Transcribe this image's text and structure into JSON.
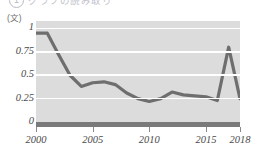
{
  "title_strip": {
    "circle_number": "1",
    "title": "グラフの読み取り",
    "visible": "partially-cropped"
  },
  "chart_data": {
    "type": "line",
    "title": "",
    "xlabel": "",
    "ylabel": "",
    "y_unit_label": "(文)",
    "grid": true,
    "legend": "none",
    "xlim": [
      2000,
      2018
    ],
    "ylim": [
      0,
      1.08
    ],
    "x_tick_labels": [
      "2000",
      "2005",
      "2010",
      "2015",
      "2018"
    ],
    "x_ticks": [
      2000,
      2005,
      2010,
      2015,
      2018
    ],
    "y_tick_labels": [
      "0",
      "0.25",
      "0.5",
      "0.75",
      "1"
    ],
    "y_ticks": [
      0,
      0.25,
      0.5,
      0.75,
      1
    ],
    "series": [
      {
        "name": "値",
        "color": "#6e6e6e",
        "x": [
          2000,
          2001,
          2002,
          2003,
          2004,
          2005,
          2006,
          2007,
          2008,
          2009,
          2010,
          2011,
          2012,
          2013,
          2014,
          2015,
          2016,
          2017,
          2018
        ],
        "values": [
          0.95,
          0.95,
          0.72,
          0.5,
          0.38,
          0.42,
          0.43,
          0.4,
          0.31,
          0.25,
          0.22,
          0.25,
          0.32,
          0.29,
          0.28,
          0.27,
          0.23,
          0.8,
          0.25
        ]
      }
    ]
  },
  "colors": {
    "plot_background": "#dcdcdc",
    "gridline": "#ffffff",
    "line": "#6e6e6e",
    "baseline": "#7a7a7a",
    "tick_text": "#4a4a4a"
  }
}
